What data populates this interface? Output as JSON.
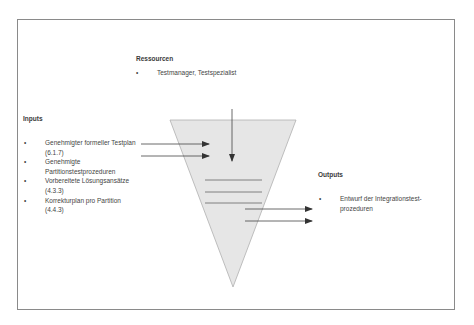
{
  "resources": {
    "heading": "Ressourcen",
    "items": [
      {
        "text": "Testmanager, Testspezialist"
      }
    ]
  },
  "inputs": {
    "heading": "Inputs",
    "items": [
      {
        "text": "Genehmigter formeller Testplan (6.1.7)"
      },
      {
        "text": "Genehmigte Partitionstestprozeduren"
      },
      {
        "text": "Vorbereitete Lösungsansätze (4.3.3)"
      },
      {
        "text": "Korrekturplan pro Partition (4.4.3)"
      }
    ]
  },
  "outputs": {
    "heading": "Outputs",
    "items": [
      {
        "text": "Entwurf der Integrationstest-prozeduren"
      }
    ]
  },
  "bullet": "•",
  "colors": {
    "funnel_fill": "#e6e6e6",
    "funnel_stroke": "#b0b0b0",
    "line": "#555555",
    "frame": "#8a8a8a"
  }
}
